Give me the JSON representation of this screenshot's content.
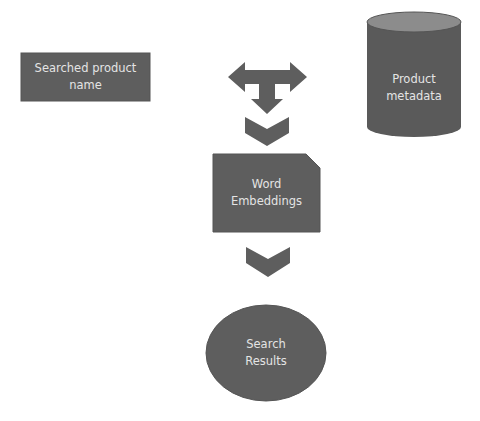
{
  "diagram": {
    "colors": {
      "shape_fill": "#5e5e5e",
      "shape_stroke": "#4a4a4a",
      "cylinder_top": "#8a8a8a",
      "text": "#e4e4e4",
      "background": "#ffffff"
    },
    "nodes": {
      "searched_product": {
        "line1": "Searched product",
        "line2": "name",
        "shape": "rectangle"
      },
      "product_metadata": {
        "line1": "Product",
        "line2": "metadata",
        "shape": "cylinder"
      },
      "word_embeddings": {
        "line1": "Word",
        "line2": "Embeddings",
        "shape": "snipped-corner-rectangle"
      },
      "search_results": {
        "line1": "Search",
        "line2": "Results",
        "shape": "ellipse"
      }
    },
    "connectors": [
      {
        "id": "merge-arrow",
        "icon": "t-merge-arrow-icon"
      },
      {
        "id": "chevron-1",
        "icon": "chevron-down-icon"
      },
      {
        "id": "chevron-2",
        "icon": "chevron-down-icon"
      }
    ]
  }
}
